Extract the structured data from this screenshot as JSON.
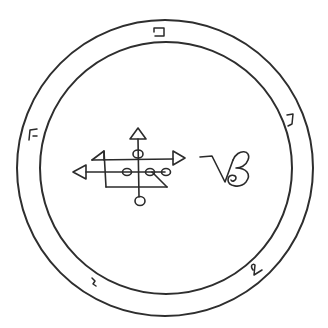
{
  "figure": {
    "ink_color": "#2b2b2b",
    "background_color": "#ffffff"
  },
  "ring": {
    "letters": [
      {
        "name": "letter-top",
        "glyph": "פ",
        "angle_deg": 0
      },
      {
        "name": "letter-upper-right",
        "glyph": "ג",
        "angle_deg": 62
      },
      {
        "name": "letter-lower-right",
        "glyph": "נ",
        "angle_deg": 140
      },
      {
        "name": "letter-lower-left",
        "glyph": "י",
        "angle_deg": 220
      },
      {
        "name": "letter-upper-left",
        "glyph": "ל",
        "angle_deg": 298
      }
    ]
  },
  "center": {
    "sigil_name": "sigil",
    "glyph_name": "saturn-like glyph",
    "glyph_text": "VB"
  }
}
